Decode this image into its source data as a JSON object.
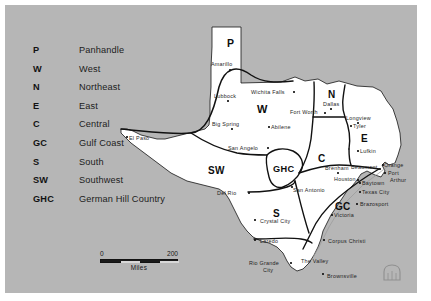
{
  "map": {
    "title": "Texas Regions Map",
    "background_color": "#b6b6b6",
    "land_color": "#ffffff",
    "border_color": "#111111",
    "legend": {
      "items": [
        {
          "abbr": "P",
          "name": "Panhandle"
        },
        {
          "abbr": "W",
          "name": "West"
        },
        {
          "abbr": "N",
          "name": "Northeast"
        },
        {
          "abbr": "E",
          "name": "East"
        },
        {
          "abbr": "C",
          "name": "Central"
        },
        {
          "abbr": "GC",
          "name": "Gulf Coast"
        },
        {
          "abbr": "S",
          "name": "South"
        },
        {
          "abbr": "SW",
          "name": "Southwest"
        },
        {
          "abbr": "GHC",
          "name": "German Hill Country"
        }
      ]
    },
    "scale": {
      "min_label": "0",
      "max_label": "200",
      "units": "Miles"
    },
    "region_codes": [
      {
        "code": "P",
        "left": 222,
        "top": 32,
        "size": 10.5
      },
      {
        "code": "W",
        "left": 252,
        "top": 98,
        "size": 11.0
      },
      {
        "code": "N",
        "left": 323,
        "top": 84,
        "size": 10.0
      },
      {
        "code": "E",
        "left": 356,
        "top": 128,
        "size": 10.0
      },
      {
        "code": "C",
        "left": 313,
        "top": 148,
        "size": 10.0
      },
      {
        "code": "GC",
        "left": 330,
        "top": 196,
        "size": 10.0
      },
      {
        "code": "S",
        "left": 268,
        "top": 203,
        "size": 10.0
      },
      {
        "code": "SW",
        "left": 203,
        "top": 160,
        "size": 10.0
      },
      {
        "code": "GHC",
        "left": 268,
        "top": 159,
        "size": 9.2
      }
    ],
    "cities": [
      {
        "name": "Amarillo",
        "label_left": 206,
        "label_top": 56,
        "dot_left": 224,
        "dot_top": 64,
        "align": "left"
      },
      {
        "name": "Lubbock",
        "label_left": 209,
        "label_top": 88,
        "dot_left": 222,
        "dot_top": 95,
        "align": "left"
      },
      {
        "name": "Wichita Falls",
        "label_left": 246,
        "label_top": 84,
        "dot_left": 288,
        "dot_top": 86,
        "align": "left"
      },
      {
        "name": "Fort Worth",
        "label_left": 285,
        "label_top": 104,
        "dot_left": 319,
        "dot_top": 107,
        "align": "left"
      },
      {
        "name": "Dallas",
        "label_left": 318,
        "label_top": 96,
        "dot_left": 325,
        "dot_top": 103,
        "align": "left"
      },
      {
        "name": "Longview",
        "label_left": 341,
        "label_top": 110,
        "dot_left": 352,
        "dot_top": 117,
        "align": "left"
      },
      {
        "name": "Tyler",
        "label_left": 348,
        "label_top": 118,
        "dot_left": 345,
        "dot_top": 120,
        "align": "left"
      },
      {
        "name": "Lufkin",
        "label_left": 355,
        "label_top": 143,
        "dot_left": 352,
        "dot_top": 145,
        "align": "left"
      },
      {
        "name": "Big Spring",
        "label_left": 207,
        "label_top": 116,
        "dot_left": 226,
        "dot_top": 123,
        "align": "left"
      },
      {
        "name": "Abilene",
        "label_left": 266,
        "label_top": 119,
        "dot_left": 263,
        "dot_top": 121,
        "align": "left"
      },
      {
        "name": "San Angelo",
        "label_left": 223,
        "label_top": 140,
        "dot_left": 262,
        "dot_top": 142,
        "align": "left"
      },
      {
        "name": "El Paso",
        "label_left": 124,
        "label_top": 130,
        "dot_left": 121,
        "dot_top": 131,
        "align": "left"
      },
      {
        "name": "Del Rio",
        "label_left": 212,
        "label_top": 185,
        "dot_left": 243,
        "dot_top": 187,
        "align": "left"
      },
      {
        "name": "San Antonio",
        "label_left": 288,
        "label_top": 182,
        "dot_left": 286,
        "dot_top": 181,
        "align": "left"
      },
      {
        "name": "Brenham",
        "label_left": 320,
        "label_top": 160,
        "dot_left": 332,
        "dot_top": 167,
        "align": "left"
      },
      {
        "name": "Houston",
        "label_left": 329,
        "label_top": 171,
        "dot_left": 352,
        "dot_top": 174,
        "align": "left"
      },
      {
        "name": "Beaumont",
        "label_left": 346,
        "label_top": 159,
        "dot_left": 374,
        "dot_top": 163,
        "align": "left"
      },
      {
        "name": "Orange",
        "label_left": 379,
        "label_top": 157,
        "dot_left": 377,
        "dot_top": 159,
        "align": "left"
      },
      {
        "name": "Port",
        "label_left": 383,
        "label_top": 165,
        "dot_left": 379,
        "dot_top": 167,
        "align": "left"
      },
      {
        "name": "Arthur",
        "label_left": 385,
        "label_top": 172,
        "dot_left": null,
        "dot_top": null,
        "align": "left"
      },
      {
        "name": "Baytown",
        "label_left": 357,
        "label_top": 175,
        "dot_left": 354,
        "dot_top": 177,
        "align": "left"
      },
      {
        "name": "Texas City",
        "label_left": 357,
        "label_top": 184,
        "dot_left": 354,
        "dot_top": 186,
        "align": "left"
      },
      {
        "name": "Brazosport",
        "label_left": 355,
        "label_top": 196,
        "dot_left": 351,
        "dot_top": 198,
        "align": "left"
      },
      {
        "name": "Victoria",
        "label_left": 329,
        "label_top": 207,
        "dot_left": 326,
        "dot_top": 209,
        "align": "left"
      },
      {
        "name": "Corpus Christi",
        "label_left": 323,
        "label_top": 233,
        "dot_left": 318,
        "dot_top": 234,
        "align": "left"
      },
      {
        "name": "Crystal City",
        "label_left": 255,
        "label_top": 213,
        "dot_left": 249,
        "dot_top": 214,
        "align": "left"
      },
      {
        "name": "Laredo",
        "label_left": 255,
        "label_top": 233,
        "dot_left": 249,
        "dot_top": 234,
        "align": "left"
      },
      {
        "name": "Rio Grande",
        "label_left": 244,
        "label_top": 255,
        "dot_left": 285,
        "dot_top": 257,
        "align": "left"
      },
      {
        "name": "City",
        "label_left": 258,
        "label_top": 262,
        "dot_left": null,
        "dot_top": null,
        "align": "left"
      },
      {
        "name": "The Valley",
        "label_left": 296,
        "label_top": 253,
        "dot_left": null,
        "dot_top": null,
        "align": "left"
      },
      {
        "name": "Brownsville",
        "label_left": 322,
        "label_top": 268,
        "dot_left": 317,
        "dot_top": 268,
        "align": "left"
      }
    ],
    "city_extra_labels": [
      {
        "text": "Crystal",
        "left": 256,
        "top": 213
      },
      {
        "text": "City",
        "left": 261,
        "top": 220
      }
    ]
  }
}
